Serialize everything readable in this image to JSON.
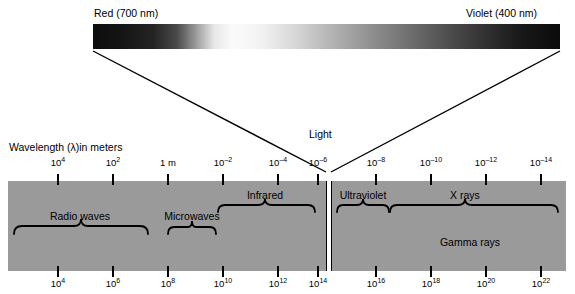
{
  "figure": {
    "band_color": "#9a9a9a",
    "background_color": "#ffffff",
    "line_color": "#000000"
  },
  "spectrum_bar": {
    "left_label": "Red (700 nm)",
    "right_label": "Violet (400 nm)",
    "gradient_description": "grayscale visible spectrum, dark at both ends, bright near the red-orange/yellow region"
  },
  "light_callout": {
    "label": "Light"
  },
  "axis": {
    "title": "Wavelength (λ)in meters",
    "top_ticks": [
      {
        "label_html": "10<sup>4</sup>",
        "text": "10^4",
        "x": 58
      },
      {
        "label_html": "10<sup>2</sup>",
        "text": "10^2",
        "x": 113
      },
      {
        "label_html": "1 m",
        "text": "1 m",
        "x": 168
      },
      {
        "label_html": "10<sup>–2</sup>",
        "text": "10^-2",
        "x": 223
      },
      {
        "label_html": "10<sup>–4</sup>",
        "text": "10^-4",
        "x": 278
      },
      {
        "label_html": "10<sup>–6</sup>",
        "text": "10^-6",
        "x": 318
      },
      {
        "label_html": "10<sup>–8</sup>",
        "text": "10^-8",
        "x": 376
      },
      {
        "label_html": "10<sup>–10</sup>",
        "text": "10^-10",
        "x": 431
      },
      {
        "label_html": "10<sup>–12</sup>",
        "text": "10^-12",
        "x": 486
      },
      {
        "label_html": "10<sup>–14</sup>",
        "text": "10^-14",
        "x": 541
      }
    ],
    "bottom_ticks": [
      {
        "label_html": "10<sup>4</sup>",
        "text": "10^4",
        "x": 58
      },
      {
        "label_html": "10<sup>6</sup>",
        "text": "10^6",
        "x": 113
      },
      {
        "label_html": "10<sup>8</sup>",
        "text": "10^8",
        "x": 168
      },
      {
        "label_html": "10<sup>10</sup>",
        "text": "10^10",
        "x": 223
      },
      {
        "label_html": "10<sup>12</sup>",
        "text": "10^12",
        "x": 278
      },
      {
        "label_html": "10<sup>14</sup>",
        "text": "10^14",
        "x": 318
      },
      {
        "label_html": "10<sup>16</sup>",
        "text": "10^16",
        "x": 376
      },
      {
        "label_html": "10<sup>18</sup>",
        "text": "10^18",
        "x": 431
      },
      {
        "label_html": "10<sup>20</sup>",
        "text": "10^20",
        "x": 486
      },
      {
        "label_html": "10<sup>22</sup>",
        "text": "10^22",
        "x": 541
      }
    ]
  },
  "regions": [
    {
      "name": "Radio waves",
      "label_x": 80,
      "label_y": 218,
      "brace_start": 14,
      "brace_end": 148
    },
    {
      "name": "Microwaves",
      "label_x": 192,
      "label_y": 218,
      "brace_start": 168,
      "brace_end": 216
    },
    {
      "name": "Infrared",
      "label_x": 265,
      "label_y": 196,
      "brace_start": 218,
      "brace_end": 315
    },
    {
      "name": "Ultraviolet",
      "label_x": 363,
      "label_y": 196,
      "brace_start": 337,
      "brace_end": 389
    },
    {
      "name": "X rays",
      "label_x": 465,
      "label_y": 196,
      "brace_start": 390,
      "brace_end": 558
    },
    {
      "name": "Gamma rays",
      "label_x": 470,
      "label_y": 243,
      "brace_start": null,
      "brace_end": null
    }
  ],
  "chart_data": {
    "type": "diagram",
    "xlabel": "Wavelength (λ) in meters / Frequency (Hz)",
    "top_axis_name": "Wavelength (λ)in meters",
    "top_axis_ticks": [
      "10^4",
      "10^2",
      "1 m",
      "10^-2",
      "10^-4",
      "10^-6",
      "10^-8",
      "10^-10",
      "10^-12",
      "10^-14"
    ],
    "bottom_axis_ticks": [
      "10^4",
      "10^6",
      "10^8",
      "10^10",
      "10^12",
      "10^14",
      "10^16",
      "10^18",
      "10^20",
      "10^22"
    ],
    "bands": [
      {
        "name": "Radio waves",
        "wavelength_range": "10^4 to ~10^-1 m",
        "frequency_range": "10^4 to ~10^9 Hz"
      },
      {
        "name": "Microwaves",
        "wavelength_range": "~10^-1 to 10^-3 m",
        "frequency_range": "~10^9 to 10^11 Hz"
      },
      {
        "name": "Infrared",
        "wavelength_range": "10^-3 to 10^-6 m",
        "frequency_range": "10^11 to 10^14 Hz"
      },
      {
        "name": "Light",
        "wavelength_range": "700 nm to 400 nm",
        "frequency_range": "~10^14 to 10^15 Hz"
      },
      {
        "name": "Ultraviolet",
        "wavelength_range": "10^-7 to 10^-8 m",
        "frequency_range": "10^15 to 10^17 Hz"
      },
      {
        "name": "X rays",
        "wavelength_range": "10^-8 to 10^-14 m",
        "frequency_range": "10^16 to 10^22 Hz"
      },
      {
        "name": "Gamma rays",
        "wavelength_range": "10^-11 to 10^-14 m",
        "frequency_range": "10^19 to 10^22 Hz"
      }
    ],
    "visible_endpoints": {
      "red_nm": 700,
      "violet_nm": 400
    }
  }
}
